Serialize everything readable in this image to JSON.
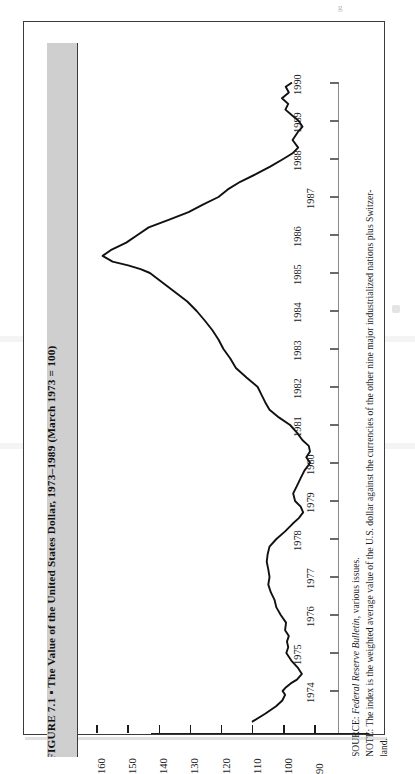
{
  "figure": {
    "title": "FIGURE 7.1 ▪ The Value of the United States Dollar, 1973–1989 (March 1973 = 100)",
    "source_prefix": "SOURCE:",
    "source_italic": "Federal Reserve Bulletin",
    "source_suffix": ", various issues.",
    "note_line_1": "NOTE: The index is the weighted average value of the U.S. dollar against the currencies of the other nine major industrialized nations plus Switzer-",
    "note_line_2": "land.",
    "page_artifact": "g"
  },
  "chart_data": {
    "type": "line",
    "title": "The Value of the United States Dollar, 1973–1989 (March 1973 = 100)",
    "orientation": "rotated-90-clockwise",
    "xlabel": "",
    "ylabel": "Index (March 1973 = 100)",
    "ylim": [
      90,
      160
    ],
    "grid": false,
    "legend": "none",
    "value_ticks": [
      160,
      150,
      140,
      130,
      120,
      110,
      100,
      90
    ],
    "year_ticks": [
      1974,
      1975,
      1976,
      1977,
      1978,
      1979,
      1980,
      1981,
      1982,
      1983,
      1984,
      1985,
      1986,
      1987,
      1988,
      1989,
      1990
    ],
    "x": [
      1973.2,
      1973.4,
      1973.6,
      1973.75,
      1973.9,
      1974.0,
      1974.1,
      1974.2,
      1974.3,
      1974.45,
      1974.6,
      1974.8,
      1975.0,
      1975.15,
      1975.3,
      1975.45,
      1975.6,
      1975.8,
      1976.0,
      1976.2,
      1976.4,
      1976.6,
      1976.8,
      1977.0,
      1977.2,
      1977.4,
      1977.6,
      1977.8,
      1978.0,
      1978.2,
      1978.4,
      1978.55,
      1978.7,
      1978.85,
      1979.0,
      1979.2,
      1979.4,
      1979.6,
      1979.8,
      1980.0,
      1980.15,
      1980.3,
      1980.45,
      1980.6,
      1980.8,
      1981.0,
      1981.2,
      1981.4,
      1981.6,
      1981.8,
      1982.0,
      1982.25,
      1982.5,
      1982.75,
      1983.0,
      1983.25,
      1983.5,
      1983.75,
      1984.0,
      1984.25,
      1984.5,
      1984.75,
      1985.0,
      1985.1,
      1985.2,
      1985.3,
      1985.45,
      1985.6,
      1985.8,
      1986.0,
      1986.2,
      1986.4,
      1986.6,
      1986.8,
      1987.0,
      1987.2,
      1987.4,
      1987.6,
      1987.8,
      1988.0,
      1988.15,
      1988.3,
      1988.5,
      1988.7,
      1988.85,
      1989.0,
      1989.15,
      1989.3,
      1989.45,
      1989.6,
      1989.75,
      1989.9,
      1990.0
    ],
    "y": [
      110.0,
      106.0,
      102.5,
      100.5,
      99.6,
      100.4,
      99.3,
      97.8,
      95.8,
      94.2,
      95.4,
      97.6,
      99.2,
      98.6,
      99.0,
      98.4,
      99.6,
      99.3,
      101.0,
      102.4,
      103.0,
      104.2,
      105.0,
      104.6,
      105.0,
      105.5,
      105.2,
      104.6,
      102.4,
      99.6,
      97.2,
      95.2,
      93.8,
      94.6,
      96.4,
      97.0,
      95.8,
      94.6,
      93.4,
      91.6,
      92.8,
      91.6,
      92.0,
      94.0,
      95.8,
      98.0,
      101.6,
      104.6,
      106.0,
      107.2,
      108.4,
      112.0,
      115.4,
      117.2,
      119.4,
      121.0,
      123.0,
      125.4,
      128.0,
      131.0,
      135.0,
      139.0,
      143.0,
      146.0,
      150.0,
      155.0,
      158.2,
      155.6,
      150.6,
      147.0,
      143.4,
      137.0,
      130.6,
      126.0,
      121.0,
      118.0,
      114.0,
      109.0,
      104.4,
      100.2,
      97.2,
      95.4,
      97.2,
      95.6,
      94.0,
      95.2,
      97.4,
      99.5,
      98.6,
      100.6,
      98.4,
      99.4,
      97.6,
      96.2
    ],
    "series_name": "Trade-weighted U.S. dollar index",
    "annotations": [
      "Peak near 158 in early 1985",
      "Trough near 91.6 in 1980"
    ]
  }
}
